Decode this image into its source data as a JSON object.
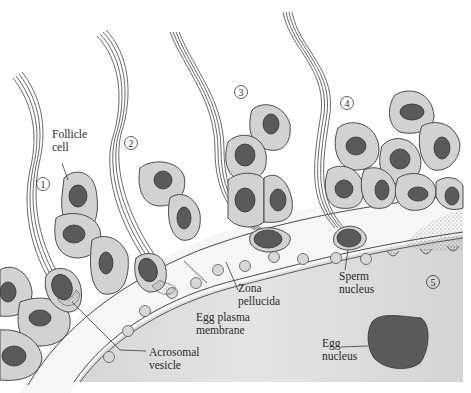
{
  "figure": {
    "labels": {
      "follicle_cell": [
        "Follicle",
        "cell"
      ],
      "acrosomal_vesicle": [
        "Acrosomal",
        "vesicle"
      ],
      "egg_plasma_membrane": [
        "Egg plasma",
        "membrane"
      ],
      "zona_pellucida": [
        "Zona",
        "pellucida"
      ],
      "sperm_nucleus": [
        "Sperm",
        "nucleus"
      ],
      "egg_nucleus": [
        "Egg",
        "nucleus"
      ]
    },
    "steps": [
      "1",
      "2",
      "3",
      "4",
      "5"
    ],
    "colors": {
      "follicle_cell_fill": "#d2d2d2",
      "nucleus_fill": "#5a5a5a",
      "egg_cytoplasm": "#dcdcdc",
      "zona_fill": "#f4f4f4",
      "outline": "#4a4a4a"
    }
  }
}
